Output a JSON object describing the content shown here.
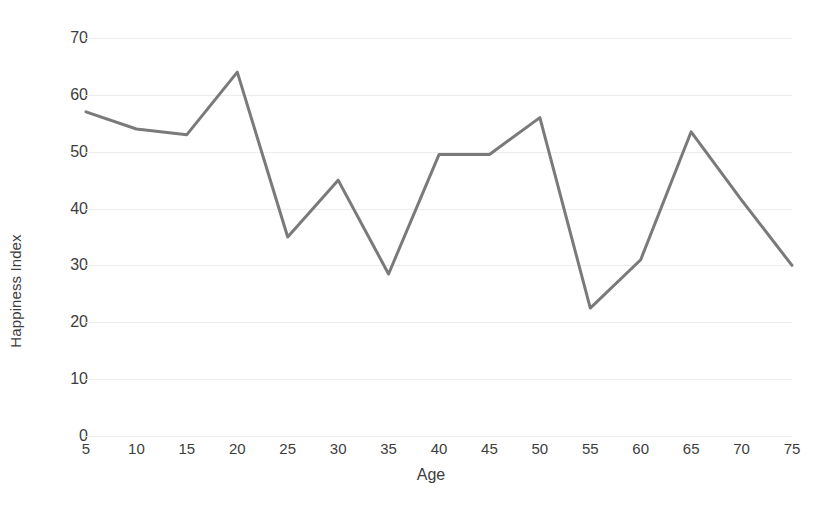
{
  "chart_data": {
    "type": "line",
    "title": "",
    "subtitle": "",
    "xlabel": "Age",
    "ylabel": "Happiness Index",
    "categories": [
      5,
      10,
      15,
      20,
      25,
      30,
      35,
      40,
      45,
      50,
      55,
      60,
      65,
      70,
      75
    ],
    "x_tick_labels": [
      "5",
      "10",
      "15",
      "20",
      "25",
      "30",
      "35",
      "40",
      "45",
      "50",
      "55",
      "60",
      "65",
      "70",
      "75"
    ],
    "values": [
      57,
      54,
      53,
      64,
      35,
      45,
      28.5,
      49.5,
      49.5,
      56,
      22.5,
      31,
      53.5,
      41.5,
      30
    ],
    "series": [
      {
        "name": "Happiness Index",
        "values": [
          57,
          54,
          53,
          64,
          35,
          45,
          28.5,
          49.5,
          49.5,
          56,
          22.5,
          31,
          53.5,
          41.5,
          30
        ]
      }
    ],
    "xlim": [
      5,
      75
    ],
    "ylim": [
      0,
      70
    ],
    "y_ticks": [
      0,
      10,
      20,
      30,
      40,
      50,
      60,
      70
    ],
    "y_tick_labels": [
      "0",
      "10",
      "20",
      "30",
      "40",
      "50",
      "60",
      "70"
    ],
    "grid": true,
    "grid_axis": "y",
    "legend": false,
    "legend_position": "none",
    "markers": false,
    "colors": {
      "line": "#7a7a7a",
      "grid": "#ededed",
      "text": "#3d3d3d",
      "background": "#ffffff"
    },
    "line_width": 3
  }
}
